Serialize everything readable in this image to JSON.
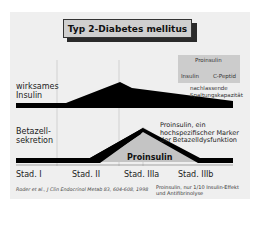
{
  "title": "Typ 2-Diabetes mellitus",
  "rows": {
    "top_label": [
      "wirksames",
      "Insulin"
    ],
    "bottom_label": [
      "Betazell-",
      "sekretion"
    ]
  },
  "proinsulin_box": {
    "parent": "Proinsulin",
    "children": [
      "Insulin",
      "C-Peptid"
    ],
    "caption": [
      "nachlassende",
      "Spaltungskapazität"
    ]
  },
  "marker_text": [
    "Proinsulin, ein",
    "hochspezifischer Marker",
    "der Betazelldysfunktion"
  ],
  "area_label": "Proinsulin",
  "stages": [
    "Stad. I",
    "Stad. II",
    "Stad. IIIa",
    "Stad. IIIb"
  ],
  "citation": "Roder et al., J Clin Endocrinol Metab 83, 604-608, 1998",
  "note": [
    "Proinsulin, nur 1/10 Insulin-Effekt",
    "und Antifibrinolyse"
  ],
  "colors": {
    "panel": "#efefef",
    "title_box": "#cfcfcf",
    "curve": "#000000",
    "proinsulin_area": "#c4c4c4"
  }
}
